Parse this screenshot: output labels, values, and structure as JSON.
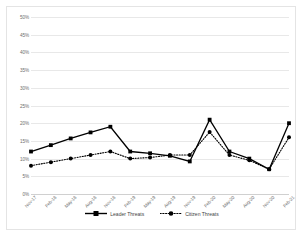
{
  "chart_data": {
    "type": "line",
    "title": "",
    "xlabel": "",
    "ylabel": "",
    "ylim": [
      0,
      50
    ],
    "ytick_step": 5,
    "ytick_labels": [
      "50%",
      "45%",
      "40%",
      "35%",
      "30%",
      "25%",
      "20%",
      "15%",
      "10%",
      "5%",
      "0%"
    ],
    "ytick_values": [
      50,
      45,
      40,
      35,
      30,
      25,
      20,
      15,
      10,
      5,
      0
    ],
    "grid": true,
    "legend_position": "bottom",
    "categories": [
      "Nov-17",
      "Feb-18",
      "May-18",
      "Aug-18",
      "Nov-18",
      "Feb-19",
      "May-19",
      "Aug-19",
      "Nov-19",
      "Feb-20",
      "May-20",
      "Aug-20",
      "Nov-20",
      "Feb-21"
    ],
    "series": [
      {
        "name": "Leader Threats",
        "style": "solid",
        "color": "#000000",
        "marker": "square",
        "values": [
          12,
          13.8,
          15.7,
          17.4,
          19,
          12,
          11.5,
          10.8,
          9.2,
          21,
          12,
          10,
          7,
          20
        ]
      },
      {
        "name": "Citizen Threats",
        "style": "dotted",
        "color": "#000000",
        "marker": "circle",
        "values": [
          8,
          9,
          10,
          11,
          12,
          10,
          10.3,
          11,
          11,
          17.5,
          11,
          9.5,
          7,
          16
        ]
      }
    ]
  },
  "legend": {
    "items": [
      {
        "label": "Leader Threats"
      },
      {
        "label": "Citizen Threats"
      }
    ]
  }
}
